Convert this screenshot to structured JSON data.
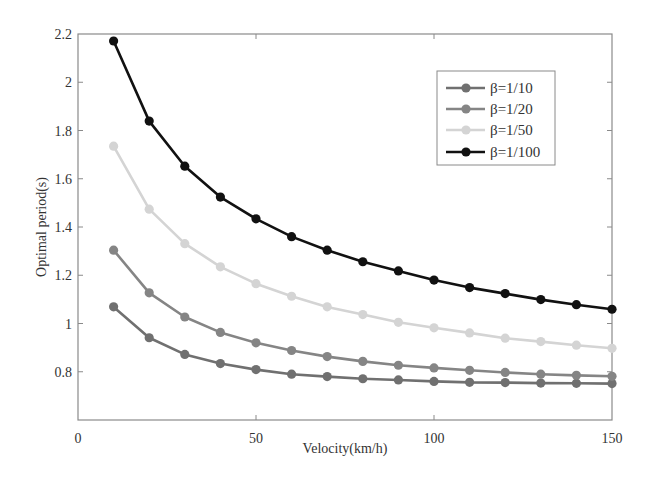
{
  "chart_data": {
    "type": "line",
    "title": "",
    "xlabel": "Velocity(km/h)",
    "ylabel": "Optimal period(s)",
    "xlim": [
      0,
      150
    ],
    "ylim": [
      0.6,
      2.2
    ],
    "xticks": [
      0,
      50,
      100,
      150
    ],
    "yticks": [
      0.8,
      1,
      1.2,
      1.4,
      1.6,
      1.8,
      2,
      2.2
    ],
    "xtick_labels": [
      "0",
      "50",
      "100",
      "150"
    ],
    "ytick_labels": [
      "0.8",
      "1",
      "1.2",
      "1.4",
      "1.6",
      "1.8",
      "2",
      "2.2"
    ],
    "grid": false,
    "legend_position": "upper right",
    "x": [
      10,
      20,
      30,
      40,
      50,
      60,
      70,
      80,
      90,
      100,
      110,
      120,
      130,
      140,
      150
    ],
    "series": [
      {
        "name": "β=1/10",
        "color": "#707070",
        "values": [
          1.069,
          0.941,
          0.872,
          0.834,
          0.809,
          0.79,
          0.78,
          0.771,
          0.766,
          0.76,
          0.756,
          0.755,
          0.753,
          0.752,
          0.751
        ]
      },
      {
        "name": "β=1/20",
        "color": "#858585",
        "values": [
          1.304,
          1.127,
          1.027,
          0.963,
          0.92,
          0.888,
          0.863,
          0.843,
          0.827,
          0.816,
          0.806,
          0.797,
          0.79,
          0.785,
          0.781
        ]
      },
      {
        "name": "β=1/50",
        "color": "#d4d4d4",
        "values": [
          1.735,
          1.474,
          1.331,
          1.235,
          1.165,
          1.113,
          1.069,
          1.037,
          1.005,
          0.982,
          0.961,
          0.939,
          0.925,
          0.91,
          0.897
        ]
      },
      {
        "name": "β=1/100",
        "color": "#111111",
        "values": [
          2.171,
          1.839,
          1.652,
          1.524,
          1.434,
          1.36,
          1.304,
          1.256,
          1.218,
          1.18,
          1.149,
          1.124,
          1.099,
          1.078,
          1.059
        ]
      }
    ]
  },
  "legend": {
    "items": [
      "β=1/10",
      "β=1/20",
      "β=1/50",
      "β=1/100"
    ]
  },
  "colors": {
    "axis": "#8a8a8a",
    "text": "#333333",
    "background": "#ffffff"
  }
}
